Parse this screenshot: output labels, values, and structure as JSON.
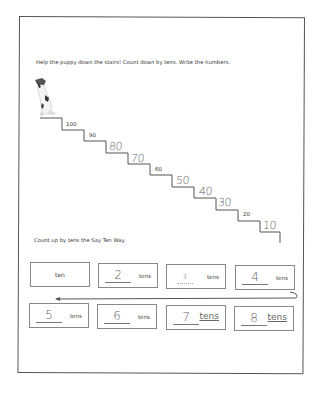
{
  "worksheet": {
    "instruction_1": "Help the puppy down the stairs!  Count down by tens.  Write the numbers.",
    "instruction_2": "Count up by tens the Say Ten Way.",
    "puppy_icon": "puppy-icon",
    "stairs": [
      {
        "value": "100",
        "style": "printed"
      },
      {
        "value": "90",
        "style": "printed"
      },
      {
        "value": "80",
        "style": "handwritten"
      },
      {
        "value": "70",
        "style": "handwritten"
      },
      {
        "value": "60",
        "style": "printed"
      },
      {
        "value": "50",
        "style": "handwritten"
      },
      {
        "value": "40",
        "style": "handwritten"
      },
      {
        "value": "30",
        "style": "handwritten"
      },
      {
        "value": "20",
        "style": "printed"
      },
      {
        "value": "10",
        "style": "handwritten"
      }
    ],
    "say_ten_boxes": [
      {
        "number": "",
        "unit": "ten"
      },
      {
        "number": "2",
        "unit": "tens",
        "number_style": "handwritten"
      },
      {
        "number": "3",
        "unit": "tens",
        "number_style": "printed"
      },
      {
        "number": "4",
        "unit": "tens",
        "number_style": "handwritten"
      },
      {
        "number": "5",
        "unit": "tens",
        "number_style": "handwritten"
      },
      {
        "number": "6",
        "unit": "tens",
        "number_style": "handwritten"
      },
      {
        "number": "7",
        "unit": "tens",
        "number_style": "handwritten",
        "unit_style": "handwritten"
      },
      {
        "number": "8",
        "unit": "tens",
        "number_style": "handwritten",
        "unit_style": "handwritten"
      }
    ],
    "arrow_direction": "right-to-left"
  }
}
